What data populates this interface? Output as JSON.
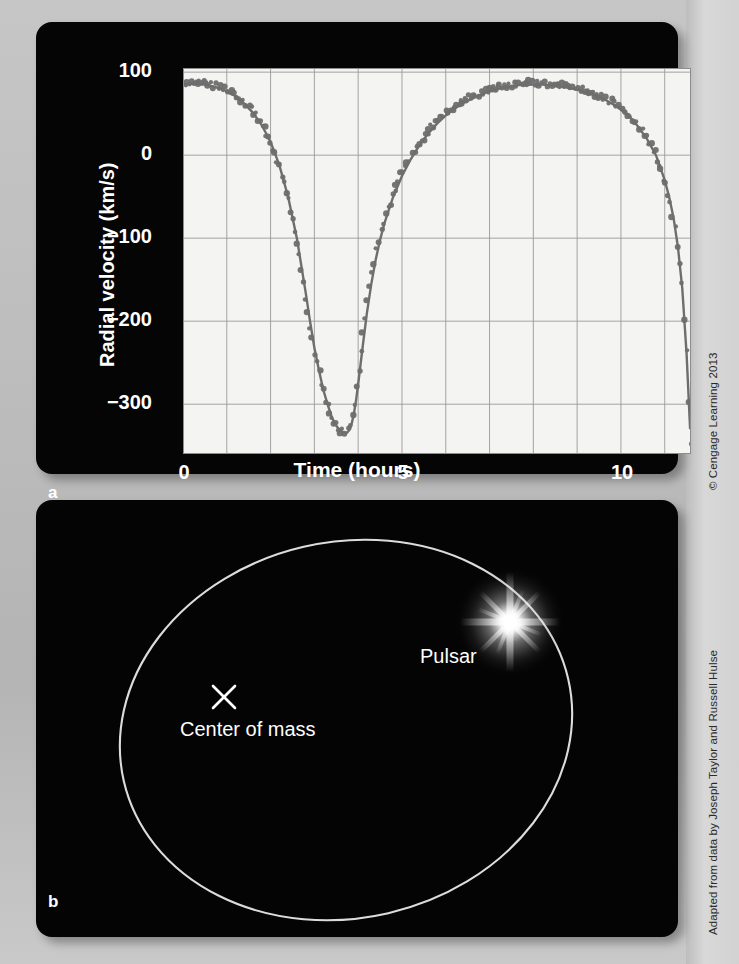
{
  "figure": {
    "panel_a_letter": "a",
    "panel_b_letter": "b"
  },
  "credits": {
    "top": "© Cengage Learning 2013",
    "bottom": "Adapted from data by Joseph Taylor and Russell Hulse"
  },
  "panel_b": {
    "pulsar_label": "Pulsar",
    "center_of_mass_label": "Center of mass",
    "center_of_mass_marker": "x-marker-icon",
    "orbit_color": "#d8d8d8",
    "star_color": "#ffffff",
    "background_color": "#040404"
  },
  "chart_data": {
    "type": "line",
    "title": "",
    "xlabel": "Time (hours)",
    "ylabel": "Radial velocity (km/s)",
    "xlim": [
      0,
      11.6
    ],
    "ylim": [
      -360,
      105
    ],
    "xticks": [
      0,
      5,
      10
    ],
    "xticklabels": [
      "0",
      "5",
      "10"
    ],
    "yticks": [
      100,
      0,
      -100,
      -200,
      -300
    ],
    "yticklabels": [
      "100",
      "0",
      "−100",
      "−200",
      "−300"
    ],
    "grid": true,
    "grid_x_step": 1,
    "grid_y_step": 100,
    "grid_color": "#9a9a9a",
    "plot_background": "#f4f4f2",
    "series_color": "#6e6e6e",
    "legend": "none",
    "period_hours": 7.75,
    "series": [
      {
        "name": "Radial velocity",
        "marker": "filled-circle",
        "x": [
          0.0,
          0.2,
          0.4,
          0.6,
          0.8,
          1.0,
          1.2,
          1.4,
          1.6,
          1.8,
          2.0,
          2.2,
          2.4,
          2.6,
          2.8,
          2.9,
          3.0,
          3.1,
          3.2,
          3.3,
          3.4,
          3.5,
          3.6,
          3.65,
          3.7,
          3.75,
          3.8,
          3.85,
          3.9,
          3.95,
          4.0,
          4.1,
          4.2,
          4.3,
          4.4,
          4.5,
          4.6,
          4.8,
          5.0,
          5.2,
          5.4,
          5.6,
          5.8,
          6.0,
          6.2,
          6.4,
          6.6,
          6.8,
          7.0,
          7.2,
          7.4,
          7.6,
          7.8,
          8.0,
          8.2,
          8.4,
          8.6,
          8.8,
          9.0,
          9.2,
          9.4,
          9.6,
          9.8,
          10.0,
          10.2,
          10.4,
          10.6,
          10.8,
          11.0,
          11.1,
          11.2,
          11.3,
          11.4,
          11.5,
          11.58
        ],
        "y": [
          85,
          86,
          86,
          84,
          81,
          77,
          71,
          62,
          51,
          36,
          16,
          -12,
          -50,
          -100,
          -165,
          -200,
          -232,
          -258,
          -282,
          -300,
          -316,
          -326,
          -332,
          -334,
          -335,
          -334,
          -331,
          -324,
          -312,
          -296,
          -276,
          -232,
          -190,
          -155,
          -126,
          -102,
          -82,
          -50,
          -25,
          -5,
          12,
          26,
          38,
          48,
          56,
          63,
          68,
          73,
          77,
          80,
          82,
          84,
          85,
          85,
          85,
          84,
          83,
          81,
          79,
          76,
          72,
          68,
          62,
          55,
          46,
          34,
          19,
          0,
          -30,
          -50,
          -75,
          -110,
          -160,
          -240,
          -330
        ]
      }
    ]
  }
}
